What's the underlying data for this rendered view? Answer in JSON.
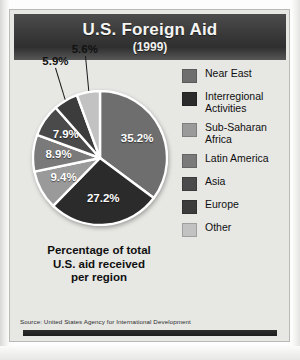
{
  "header": {
    "title": "U.S. Foreign Aid",
    "subtitle": "(1999)"
  },
  "caption": "Percentage of total\nU.S. aid received\nper region",
  "source": "Source: United States Agency for International Development",
  "legend": {
    "items": [
      {
        "label": "Near East",
        "color": "#6e6e6e"
      },
      {
        "label": "Interregional\nActivities",
        "color": "#2b2b2b"
      },
      {
        "label": "Sub-Saharan\nAfrica",
        "color": "#9a9a9a"
      },
      {
        "label": "Latin America",
        "color": "#7a7a7a"
      },
      {
        "label": "Asia",
        "color": "#4a4a4a"
      },
      {
        "label": "Europe",
        "color": "#3c3c3c"
      },
      {
        "label": "Other",
        "color": "#c2c2c2"
      }
    ]
  },
  "chart_data": {
    "type": "pie",
    "title": "U.S. Foreign Aid",
    "subtitle": "(1999)",
    "unit": "percent",
    "total": 100.1,
    "legend_position": "right",
    "categories": [
      "Near East",
      "Interregional Activities",
      "Sub-Saharan Africa",
      "Latin America",
      "Asia",
      "Europe",
      "Other"
    ],
    "values": [
      35.2,
      27.2,
      9.4,
      8.9,
      7.9,
      5.9,
      5.6
    ],
    "labels": [
      "35.2%",
      "27.2%",
      "9.4%",
      "8.9%",
      "7.9%",
      "5.9%",
      "5.6%"
    ],
    "colors": [
      "#6e6e6e",
      "#2b2b2b",
      "#9a9a9a",
      "#7a7a7a",
      "#4a4a4a",
      "#3c3c3c",
      "#c2c2c2"
    ],
    "label_placement": [
      "inside",
      "inside",
      "inside",
      "inside",
      "inside",
      "outside",
      "outside"
    ],
    "start_angle_deg": 0,
    "direction": "clockwise",
    "slice_separator_color": "#ffffff",
    "annotations": [
      "Percentage of total U.S. aid received per region"
    ]
  }
}
